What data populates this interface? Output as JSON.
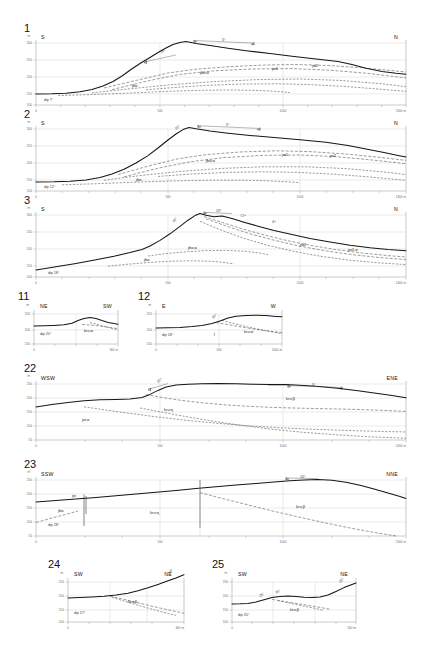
{
  "figure": {
    "kind": "geological-cross-sections",
    "units_axis": "m"
  },
  "panels": [
    {
      "id": "p1",
      "number": "1",
      "left_dir": "S",
      "right_dir": "N",
      "dip": "dip 7°",
      "x_ticks": [
        "0",
        "500",
        "1000",
        "1500 m"
      ],
      "y_ticks": [
        "300",
        "250",
        "200",
        "150",
        "100"
      ],
      "y_unit": "m",
      "unit_labels": [
        "jbo",
        "jbo;α",
        "jw1",
        "jw2"
      ],
      "angle_labels": [
        "10°",
        "5°",
        "3°"
      ]
    },
    {
      "id": "p2",
      "number": "2",
      "left_dir": "S",
      "right_dir": "N",
      "dip": "dip 12°",
      "x_ticks": [
        "0",
        "500",
        "1000",
        "1400 m"
      ],
      "y_ticks": [
        "300",
        "250",
        "200",
        "150",
        "100"
      ],
      "y_unit": "m",
      "unit_labels": [
        "jbo",
        "jbo;α",
        "jw1",
        "jw2"
      ],
      "angle_labels": [
        "16°",
        "5°",
        "4°"
      ]
    },
    {
      "id": "p3",
      "number": "3",
      "left_dir": "S",
      "right_dir": "N",
      "dip": "dip 18°",
      "x_ticks": [
        "0",
        "500",
        "1000",
        "1400 m"
      ],
      "y_ticks": [
        "300",
        "250",
        "200",
        "150",
        "100"
      ],
      "y_unit": "m",
      "unit_labels": [
        "jbo",
        "jbo;α",
        "jw2",
        "jw1;α"
      ],
      "angle_labels": [
        "20°",
        "19°",
        "12°",
        "8°"
      ]
    },
    {
      "id": "p11",
      "number": "11",
      "left_dir": "NE",
      "right_dir": "SW",
      "dip": "dip 20°",
      "x_ticks": [
        "0",
        "300 m"
      ],
      "y_ticks": [
        "250",
        "200",
        "150"
      ],
      "y_unit": "m",
      "unit_labels": [
        "kru;α"
      ],
      "angle_labels": []
    },
    {
      "id": "p12",
      "number": "12",
      "left_dir": "E",
      "right_dir": "W",
      "dip": "dip 18°",
      "x_ticks": [
        "0",
        "500",
        "1000 m"
      ],
      "y_ticks": [
        "250",
        "200",
        "150"
      ],
      "y_unit": "m",
      "unit_labels": [
        "j",
        "kru;α"
      ],
      "angle_labels": [
        "10°",
        "6°"
      ]
    },
    {
      "id": "p22",
      "number": "22",
      "left_dir": "WSW",
      "right_dir": "ENE",
      "dip": "",
      "x_ticks": [
        "0",
        "500",
        "1000",
        "1500 m"
      ],
      "y_ticks": [
        "250",
        "200",
        "150",
        "100",
        "50"
      ],
      "y_unit": "m",
      "unit_labels": [
        "kru;β",
        "kru;η",
        "jw;α"
      ],
      "angle_labels": [
        "20°",
        "3°"
      ]
    },
    {
      "id": "p23",
      "number": "23",
      "left_dir": "SSW",
      "right_dir": "NNE",
      "dip": "dip 28°",
      "x_ticks": [
        "0",
        "500",
        "1000",
        "1500 m"
      ],
      "y_ticks": [
        "250",
        "200",
        "150",
        "100",
        "50"
      ],
      "y_unit": "m",
      "unit_labels": [
        "jw",
        "jbo",
        "kru;η",
        "kru;β"
      ],
      "angle_labels": [
        "10°"
      ]
    },
    {
      "id": "p24",
      "number": "24",
      "left_dir": "SW",
      "right_dir": "NE",
      "dip": "dip 17°",
      "x_ticks": [
        "0",
        "300 m"
      ],
      "y_ticks": [
        "250",
        "200",
        "150",
        "100"
      ],
      "y_unit": "m",
      "unit_labels": [
        "kru;β"
      ],
      "angle_labels": [
        "35°"
      ]
    },
    {
      "id": "p25",
      "number": "25",
      "left_dir": "SW",
      "right_dir": "NE",
      "dip": "dip 20°",
      "x_ticks": [
        "0",
        "500 m"
      ],
      "y_ticks": [
        "250",
        "200",
        "150",
        "100"
      ],
      "y_unit": "m",
      "unit_labels": [
        "kru;β"
      ],
      "angle_labels": [
        "25°",
        "30°",
        "25°"
      ]
    }
  ]
}
